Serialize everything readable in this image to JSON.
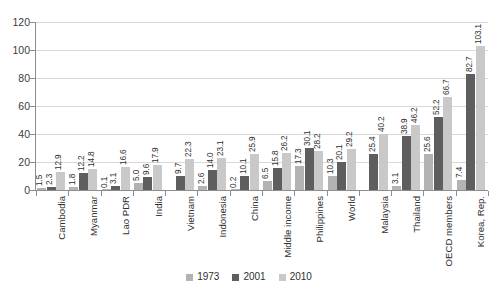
{
  "chart_data": {
    "type": "bar",
    "title": "",
    "subtitle": "",
    "xlabel": "",
    "ylabel": "",
    "ylim": [
      0,
      120
    ],
    "ytick_step": 20,
    "yticks": [
      "0",
      "20",
      "40",
      "60",
      "80",
      "100",
      "120"
    ],
    "grid": true,
    "legend_position": "bottom",
    "orientation": "vertical-grouped",
    "categories": [
      "Cambodia",
      "Myanmar",
      "Lao PDR",
      "India",
      "Vietnam",
      "Indonesia",
      "China",
      "Middle income",
      "Philippines",
      "World",
      "Malaysia",
      "Thailand",
      "OECD members",
      "Korea, Rep."
    ],
    "series": [
      {
        "name": "1973",
        "color": "#b3b3b3",
        "values": [
          1.5,
          1.8,
          0.1,
          5.0,
          null,
          2.6,
          0.2,
          6.5,
          17.3,
          10.3,
          null,
          3.1,
          25.6,
          7.4
        ]
      },
      {
        "name": "2001",
        "color": "#5e5e5e",
        "values": [
          2.3,
          12.2,
          3.1,
          9.6,
          9.7,
          14.0,
          10.1,
          15.8,
          30.1,
          20.1,
          25.4,
          38.9,
          52.2,
          82.7
        ]
      },
      {
        "name": "2010",
        "color": "#c9c9c9",
        "values": [
          12.9,
          14.8,
          16.6,
          17.9,
          22.3,
          23.1,
          25.9,
          26.2,
          28.2,
          29.2,
          40.2,
          46.2,
          66.7,
          103.1
        ]
      }
    ],
    "data_labels": [
      {
        "category": "Cambodia",
        "labels": [
          "1.5",
          "2.3",
          "12.9"
        ]
      },
      {
        "category": "Myanmar",
        "labels": [
          "1.8",
          "12.2",
          "14.8"
        ]
      },
      {
        "category": "Lao PDR",
        "labels": [
          "0.1",
          "3.1",
          "16.6"
        ]
      },
      {
        "category": "India",
        "labels": [
          "5.0",
          "9.6",
          "17.9"
        ]
      },
      {
        "category": "Vietnam",
        "labels": [
          "9.7",
          "22.3"
        ]
      },
      {
        "category": "Indonesia",
        "labels": [
          "2.6",
          "14.0",
          "23.1"
        ]
      },
      {
        "category": "China",
        "labels": [
          "0.2",
          "10.1",
          "25.9"
        ]
      },
      {
        "category": "Middle income",
        "labels": [
          "6.5",
          "15.8",
          "26.2"
        ]
      },
      {
        "category": "Philippines",
        "labels": [
          "17.3",
          "30.1",
          "28.2"
        ]
      },
      {
        "category": "World",
        "labels": [
          "10.3",
          "20.1",
          "29.2"
        ]
      },
      {
        "category": "Malaysia",
        "labels": [
          "25.4",
          "40.2"
        ]
      },
      {
        "category": "Thailand",
        "labels": [
          "3.1",
          "38.9",
          "46.2"
        ]
      },
      {
        "category": "OECD members",
        "labels": [
          "25.6",
          "52.2",
          "66.7"
        ]
      },
      {
        "category": "Korea, Rep.",
        "labels": [
          "7.4",
          "82.7",
          "103.1"
        ]
      }
    ],
    "legend": [
      {
        "label": "1973",
        "color": "#b3b3b3"
      },
      {
        "label": "2001",
        "color": "#5e5e5e"
      },
      {
        "label": "2010",
        "color": "#c9c9c9"
      }
    ]
  }
}
